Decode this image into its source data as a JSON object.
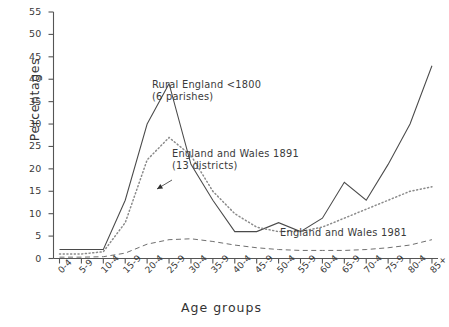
{
  "chart_data": {
    "type": "line",
    "title": "",
    "xlabel": "Age groups",
    "ylabel": "Percentages",
    "ylim": [
      0,
      55
    ],
    "ytick_step": 5,
    "yticks": [
      0,
      5,
      10,
      15,
      20,
      25,
      30,
      35,
      40,
      45,
      50,
      55
    ],
    "grid": false,
    "legend_position": "inline-annotations",
    "categories": [
      "0-4",
      "5-9",
      "10-4",
      "15-9",
      "20-4",
      "25-9",
      "30-4",
      "35-9",
      "40-4",
      "45-9",
      "50-4",
      "55-9",
      "60-4",
      "65-9",
      "70-4",
      "75-9",
      "80-4",
      "85+"
    ],
    "series": [
      {
        "name": "Rural England <1800 (6 parishes)",
        "style": "solid",
        "color": "#4a4a4a",
        "values": [
          2,
          2,
          2,
          13,
          30,
          39,
          21,
          13,
          6,
          6,
          8,
          6,
          9,
          17,
          13,
          21,
          30,
          43
        ]
      },
      {
        "name": "England and Wales 1891 (13 districts)",
        "style": "dotted",
        "color": "#8a8a8a",
        "values": [
          1,
          1,
          1.5,
          8,
          22,
          27,
          23,
          15,
          10,
          7,
          6,
          6,
          7,
          9,
          11,
          13,
          15,
          16
        ]
      },
      {
        "name": "England and Wales 1981",
        "style": "dashed",
        "color": "#6f6f6f",
        "values": [
          0.3,
          0.3,
          0.4,
          1.2,
          3.2,
          4.2,
          4.4,
          3.8,
          3.0,
          2.4,
          2.0,
          1.8,
          1.8,
          1.8,
          2.0,
          2.4,
          3.0,
          4.2
        ]
      }
    ],
    "annotations": [
      {
        "id": "ann-rural-england",
        "lines": [
          "Rural England <1800",
          "(6 parishes)"
        ],
        "x_px": 152,
        "y_px": 79
      },
      {
        "id": "ann-england-wales-1891",
        "lines": [
          "England and Wales 1891",
          "(13 districts)"
        ],
        "x_px": 172,
        "y_px": 148
      },
      {
        "id": "ann-england-wales-1981",
        "lines": [
          "England and Wales 1981"
        ],
        "x_px": 280,
        "y_px": 227
      }
    ],
    "leader_lines": [
      {
        "id": "leader-1891",
        "x1": 172,
        "y1": 180,
        "x2": 157,
        "y2": 189,
        "arrow": true
      }
    ]
  }
}
